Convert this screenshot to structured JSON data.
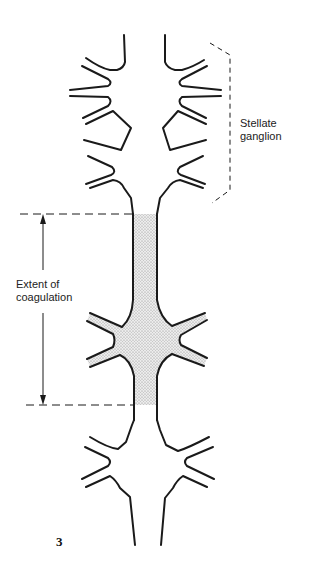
{
  "figure": {
    "number": "3",
    "labels": {
      "stellate_line1": "Stellate",
      "stellate_line2": "ganglion",
      "extent_line1": "Extent of",
      "extent_line2": "coagulation"
    },
    "colors": {
      "stroke": "#1a1a1a",
      "stipple": "#c8c8c8",
      "background": "#ffffff"
    },
    "structures": [
      "upper-stellate-ganglion",
      "sympathetic-trunk",
      "coagulated-middle-ganglion",
      "lower-ganglion"
    ]
  }
}
